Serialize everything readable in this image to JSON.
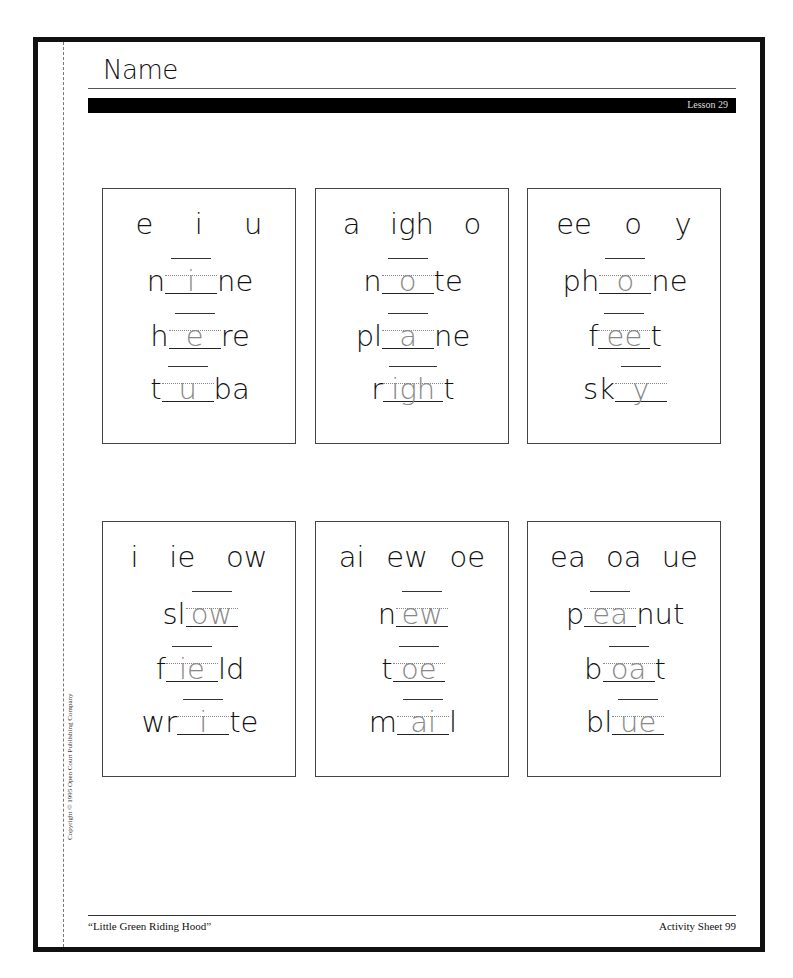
{
  "header": {
    "name_label": "Name",
    "lesson": "Lesson 29"
  },
  "cards": [
    {
      "choices": [
        "e",
        "i",
        "u"
      ],
      "words": [
        {
          "before": "n",
          "answer": "i",
          "after": "ne"
        },
        {
          "before": "h",
          "answer": "e",
          "after": "re"
        },
        {
          "before": "t",
          "answer": "u",
          "after": "ba"
        }
      ]
    },
    {
      "choices": [
        "a",
        "igh",
        "o"
      ],
      "words": [
        {
          "before": "n",
          "answer": "o",
          "after": "te"
        },
        {
          "before": "pl",
          "answer": "a",
          "after": "ne"
        },
        {
          "before": "r",
          "answer": "igh",
          "after": "t"
        }
      ]
    },
    {
      "choices": [
        "ee",
        "o",
        "y"
      ],
      "words": [
        {
          "before": "ph",
          "answer": "o",
          "after": "ne"
        },
        {
          "before": "f",
          "answer": "ee",
          "after": "t"
        },
        {
          "before": "sk",
          "answer": "y",
          "after": ""
        }
      ]
    },
    {
      "choices": [
        "i",
        "ie",
        "ow"
      ],
      "words": [
        {
          "before": "sl",
          "answer": "ow",
          "after": ""
        },
        {
          "before": "f",
          "answer": "ie",
          "after": "ld"
        },
        {
          "before": "wr",
          "answer": "i",
          "after": "te"
        }
      ]
    },
    {
      "choices": [
        "ai",
        "ew",
        "oe"
      ],
      "words": [
        {
          "before": "n",
          "answer": "ew",
          "after": ""
        },
        {
          "before": "t",
          "answer": "oe",
          "after": ""
        },
        {
          "before": "m",
          "answer": "ai",
          "after": "l"
        }
      ]
    },
    {
      "choices": [
        "ea",
        "oa",
        "ue"
      ],
      "words": [
        {
          "before": "p",
          "answer": "ea",
          "after": "nut"
        },
        {
          "before": "b",
          "answer": "oa",
          "after": "t"
        },
        {
          "before": "bl",
          "answer": "ue",
          "after": ""
        }
      ]
    }
  ],
  "footer": {
    "story_title": "“Little Green Riding Hood”",
    "sheet": "Activity Sheet 99",
    "copyright": "Copyright © 1995 Open Court Publishing Company"
  },
  "colors": {
    "ink": "#111111",
    "trace": "#888888",
    "bar": "#000000"
  }
}
